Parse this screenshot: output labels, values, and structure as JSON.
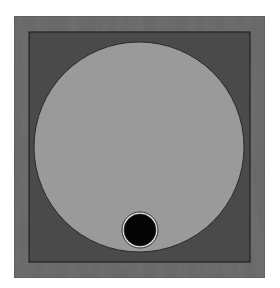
{
  "canvas": {
    "width": 280,
    "height": 288,
    "background": "#ffffff"
  },
  "diagram": {
    "outer_frame": {
      "x": 14,
      "y": 16,
      "width": 251,
      "height": 262,
      "fill": "#707070",
      "stroke": "#5a5a5a",
      "texture": "wood-grain"
    },
    "inner_square": {
      "x": 29,
      "y": 32,
      "width": 221,
      "height": 230,
      "fill": "#4a4a4a",
      "stroke": "#222222"
    },
    "disc": {
      "cx": 139,
      "cy": 147,
      "r": 105,
      "fill": "#9a9a9a",
      "stroke": "#2a2a2a"
    },
    "hole": {
      "cx": 140,
      "cy": 230,
      "r": 16,
      "fill": "#050505",
      "ring_color": "#e6e6e6",
      "outline": "#333333"
    }
  }
}
